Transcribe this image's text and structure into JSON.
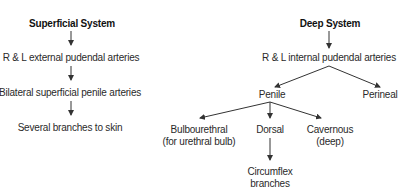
{
  "superficial": {
    "title": "Superficial System",
    "nodes": [
      "R & L external pudendal arteries",
      "Bilateral superficial penile arteries",
      "Several branches to skin"
    ]
  },
  "deep": {
    "title": "Deep System",
    "root": "R & L internal pudendal arteries",
    "level1": [
      "Penile",
      "Perineal"
    ],
    "penile_branches": {
      "bulbourethral": [
        "Bulbourethral",
        "(for urethral bulb)"
      ],
      "dorsal": "Dorsal",
      "cavernous": [
        "Cavernous",
        "(deep)"
      ]
    },
    "dorsal_branch": [
      "Circumflex",
      "branches"
    ]
  },
  "colors": {
    "text": "#2a2a2a",
    "arrow": "#333333"
  }
}
